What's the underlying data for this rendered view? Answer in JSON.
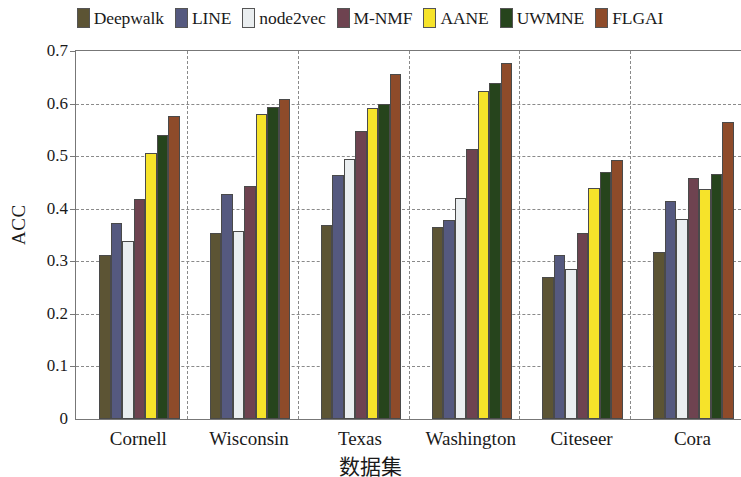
{
  "chart_data": {
    "type": "bar",
    "title": "",
    "xlabel": "数据集",
    "ylabel": "ACC",
    "ylim": [
      0,
      0.7
    ],
    "ytick_labels": [
      "0",
      "0.1",
      "0.2",
      "0.3",
      "0.4",
      "0.5",
      "0.6",
      "0.7"
    ],
    "ytick_values": [
      0,
      0.1,
      0.2,
      0.3,
      0.4,
      0.5,
      0.6,
      0.7
    ],
    "grid": "horizontal-dashed-and-vertical-group-separators",
    "legend_position": "top-center-outside",
    "categories": [
      "Cornell",
      "Wisconsin",
      "Texas",
      "Washington",
      "Citeseer",
      "Cora"
    ],
    "series": [
      {
        "name": "Deepwalk",
        "color": "#5c5434",
        "values": [
          0.312,
          0.354,
          0.37,
          0.366,
          0.27,
          0.317
        ]
      },
      {
        "name": "LINE",
        "color": "#55597f",
        "values": [
          0.373,
          0.428,
          0.465,
          0.379,
          0.312,
          0.414
        ]
      },
      {
        "name": "node2vec",
        "color": "#eaeef0",
        "values": [
          0.338,
          0.357,
          0.494,
          0.42,
          0.286,
          0.38
        ]
      },
      {
        "name": "M-NMF",
        "color": "#6e4350",
        "values": [
          0.418,
          0.443,
          0.547,
          0.513,
          0.353,
          0.459
        ]
      },
      {
        "name": "AANE",
        "color": "#f6e32a",
        "values": [
          0.506,
          0.581,
          0.591,
          0.623,
          0.439,
          0.437
        ]
      },
      {
        "name": "UWMNE",
        "color": "#26441c",
        "values": [
          0.541,
          0.594,
          0.6,
          0.64,
          0.47,
          0.467
        ]
      },
      {
        "name": "FLGAI",
        "color": "#8e4b2a",
        "values": [
          0.577,
          0.609,
          0.657,
          0.678,
          0.493,
          0.565
        ]
      }
    ]
  }
}
